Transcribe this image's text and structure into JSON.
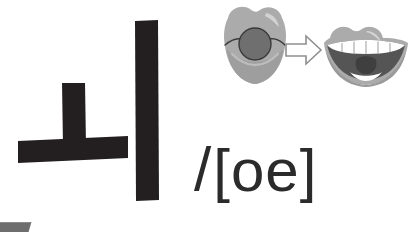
{
  "slide": {
    "background_color": "#ffffff",
    "width": 416,
    "height": 232
  },
  "hangul": {
    "syllable": "ㅚ",
    "components": [
      {
        "name": "vowel-o",
        "jamo": "ㅗ"
      },
      {
        "name": "vowel-i",
        "jamo": "ㅣ"
      }
    ],
    "ink_color": "#231f20"
  },
  "mouth_diagram": {
    "arrow_label": "⇨",
    "arrow_outline_color": "#8f8f8f",
    "arrow_fill_color": "#ffffff",
    "lip_color": "#ababab",
    "lip_shadow_color": "#9a9a9a",
    "lip_highlight_color": "#cfcfcf",
    "mouth_opening_color": "#6f6f6f",
    "teeth_color": "#ffffff",
    "interior_color": "#555555",
    "tongue_color": "#3f3f3f",
    "before": {
      "name": "rounded-lips-mouth",
      "description": "rounded pursed lips with small circular opening"
    },
    "after": {
      "name": "open-mouth",
      "description": "open mouth showing teeth and tongue"
    }
  },
  "transcription": {
    "slash": "/",
    "bracketed_value": "[oe]",
    "text_color": "#2b2b2b"
  },
  "corner_bar": {
    "name": "cut-off-gray-bar",
    "color": "#6e6e6e"
  }
}
